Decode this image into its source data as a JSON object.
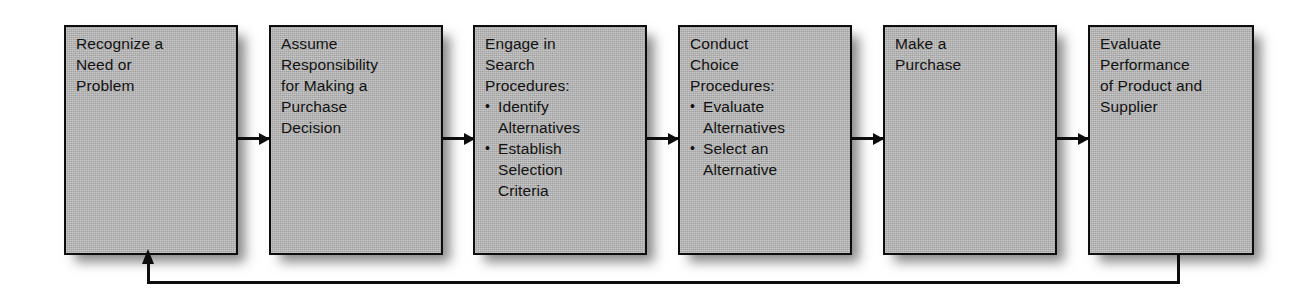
{
  "diagram": {
    "type": "linear-process-flow-with-feedback-loop",
    "box_fill_color": "#b2b2b2",
    "line_color": "#0d0d0d",
    "background_color": "#ffffff",
    "steps": [
      {
        "index": 1,
        "name": "recognize-need",
        "lines": [
          {
            "text": "Recognize a",
            "style": "plain"
          },
          {
            "text": "Need or",
            "style": "plain"
          },
          {
            "text": "Problem",
            "style": "plain"
          }
        ]
      },
      {
        "index": 2,
        "name": "assume-responsibility",
        "lines": [
          {
            "text": "Assume",
            "style": "plain"
          },
          {
            "text": "Responsibility",
            "style": "plain"
          },
          {
            "text": "for Making a",
            "style": "plain"
          },
          {
            "text": "Purchase",
            "style": "plain"
          },
          {
            "text": "Decision",
            "style": "plain"
          }
        ]
      },
      {
        "index": 3,
        "name": "engage-search-procedures",
        "lines": [
          {
            "text": "Engage in",
            "style": "plain"
          },
          {
            "text": "Search",
            "style": "plain"
          },
          {
            "text": "Procedures:",
            "style": "plain"
          },
          {
            "text": "Identify",
            "style": "bullet"
          },
          {
            "text": "Alternatives",
            "style": "continuation"
          },
          {
            "text": "Establish",
            "style": "bullet"
          },
          {
            "text": "Selection",
            "style": "continuation"
          },
          {
            "text": "Criteria",
            "style": "continuation"
          }
        ]
      },
      {
        "index": 4,
        "name": "conduct-choice-procedures",
        "lines": [
          {
            "text": "Conduct",
            "style": "plain"
          },
          {
            "text": "Choice",
            "style": "plain"
          },
          {
            "text": "Procedures:",
            "style": "plain"
          },
          {
            "text": "Evaluate",
            "style": "bullet"
          },
          {
            "text": "Alternatives",
            "style": "continuation"
          },
          {
            "text": "Select an",
            "style": "bullet"
          },
          {
            "text": "Alternative",
            "style": "continuation"
          }
        ]
      },
      {
        "index": 5,
        "name": "make-purchase",
        "lines": [
          {
            "text": "Make a",
            "style": "plain"
          },
          {
            "text": "Purchase",
            "style": "plain"
          }
        ]
      },
      {
        "index": 6,
        "name": "evaluate-performance",
        "lines": [
          {
            "text": "Evaluate",
            "style": "plain"
          },
          {
            "text": "Performance",
            "style": "plain"
          },
          {
            "text": "of Product and",
            "style": "plain"
          },
          {
            "text": "Supplier",
            "style": "plain"
          }
        ]
      }
    ],
    "connectors": [
      {
        "name": "arrow-step1-to-step2",
        "direction": "right"
      },
      {
        "name": "arrow-step2-to-step3",
        "direction": "right"
      },
      {
        "name": "arrow-step3-to-step4",
        "direction": "right"
      },
      {
        "name": "arrow-step4-to-step5",
        "direction": "right"
      },
      {
        "name": "arrow-step5-to-step6",
        "direction": "right"
      }
    ],
    "feedback_loop": {
      "name": "feedback-loop-step6-to-step1",
      "from_step": 6,
      "to_step": 1,
      "direction": "up"
    }
  }
}
